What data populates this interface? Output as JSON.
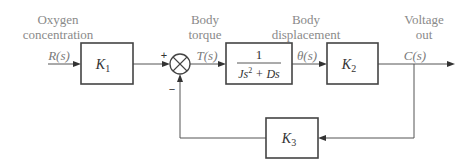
{
  "diagram": {
    "type": "block-diagram",
    "labels": {
      "input_desc_line1": "Oxygen",
      "input_desc_line2": "concentration",
      "torque_desc_line1": "Body",
      "torque_desc_line2": "torque",
      "displacement_desc_line1": "Body",
      "displacement_desc_line2": "displacement",
      "output_desc_line1": "Voltage",
      "output_desc_line2": "out"
    },
    "signals": {
      "input": "R(s)",
      "torque": "T(s)",
      "displacement": "θ(s)",
      "output": "C(s)"
    },
    "blocks": {
      "k1": {
        "name": "K",
        "sub": "1"
      },
      "plant": {
        "numerator": "1",
        "denominator_a": "Js",
        "denominator_exp": "2",
        "denominator_b": " + Ds"
      },
      "k2": {
        "name": "K",
        "sub": "2"
      },
      "k3": {
        "name": "K",
        "sub": "3"
      }
    },
    "summing_junction": {
      "plus_sign": "+",
      "minus_sign": "−"
    }
  }
}
